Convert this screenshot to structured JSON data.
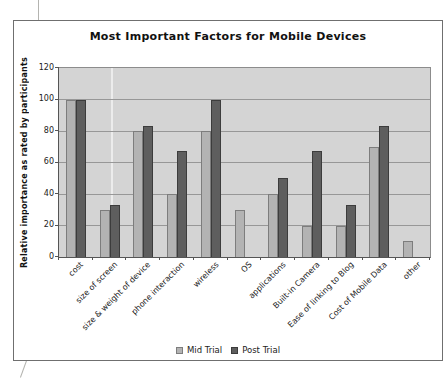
{
  "chart_data": {
    "type": "bar",
    "title": "Most Important Factors for Mobile Devices",
    "xlabel": "",
    "ylabel": "Relative importance as rated by participants",
    "categories": [
      "cost",
      "size of screen",
      "size & weight of device",
      "phone interaction",
      "wireless",
      "OS",
      "applications",
      "Built-in Camera",
      "Ease of linking to Blog",
      "Cost of Mobile Data",
      "other"
    ],
    "series": [
      {
        "name": "Mid Trial",
        "color": "#b3b3b3",
        "values": [
          100,
          30,
          80,
          40,
          80,
          30,
          40,
          20,
          20,
          70,
          10
        ]
      },
      {
        "name": "Post Trial",
        "color": "#5e5e5e",
        "values": [
          100,
          33,
          83,
          67,
          100,
          0,
          50,
          67,
          33,
          83,
          0
        ]
      }
    ],
    "ylim": [
      0,
      120
    ],
    "yticks": [
      0,
      20,
      40,
      60,
      80,
      100,
      120
    ],
    "grid": true,
    "legend_position": "bottom",
    "plot_background": "#d4d4d4"
  }
}
